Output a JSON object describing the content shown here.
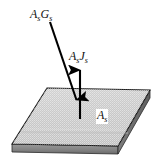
{
  "figure": {
    "colors": {
      "surface_top": "#c9c9c9",
      "surface_top_light": "#d6d6d6",
      "surface_edge_front": "#8a8a8a",
      "surface_edge_right": "#6e6e6e",
      "outline": "#1a1a1a",
      "arrow": "#000000",
      "background": "#ffffff",
      "text": "#111111"
    },
    "labels": {
      "incident": {
        "base": "A",
        "base_sub": "s",
        "second": "G",
        "second_sub": "s",
        "text": "A_s G_s",
        "meaning": "incident-irradiation-label"
      },
      "emitted": {
        "base": "A",
        "base_sub": "s",
        "second": "J",
        "second_sub": "s",
        "text": "A_s J_s",
        "meaning": "radiosity-label"
      },
      "area": {
        "base": "A",
        "base_sub": "s",
        "text": "A_s",
        "meaning": "surface-area-label"
      }
    },
    "arrows": [
      {
        "name": "incident-radiation-arrow",
        "direction": "down-right",
        "from": [
          50,
          22
        ],
        "to": [
          78,
          107
        ],
        "label": "A_s G_s"
      },
      {
        "name": "emitted-radiation-arrow",
        "direction": "up",
        "from": [
          80,
          119
        ],
        "to": [
          80,
          65
        ],
        "label": "A_s J_s"
      }
    ],
    "surface": {
      "name": "surface-plate",
      "shape": "parallelogram-slab",
      "top_face_points": [
        [
          47,
          88
        ],
        [
          150,
          90
        ],
        [
          118,
          146
        ],
        [
          12,
          144
        ]
      ],
      "thickness": 8
    }
  }
}
